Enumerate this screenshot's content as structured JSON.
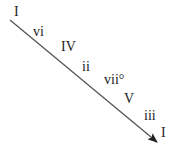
{
  "diagram": {
    "title": "",
    "line_color": "#555555",
    "labels": [
      {
        "text": "I",
        "x": 14,
        "y": 5
      },
      {
        "text": "vi",
        "x": 33,
        "y": 25
      },
      {
        "text": "IV",
        "x": 61,
        "y": 40
      },
      {
        "text": "ii",
        "x": 82,
        "y": 60
      },
      {
        "text": "vii°",
        "x": 104,
        "y": 73
      },
      {
        "text": "V",
        "x": 124,
        "y": 92
      },
      {
        "text": "iii",
        "x": 144,
        "y": 109
      },
      {
        "text": "I",
        "x": 161,
        "y": 126
      }
    ]
  }
}
